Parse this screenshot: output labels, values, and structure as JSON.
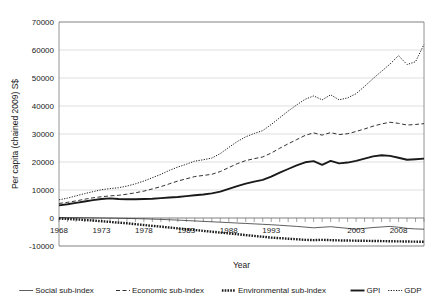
{
  "chart_data": {
    "type": "line",
    "title": "",
    "xlabel": "Year",
    "ylabel": "Per capita (chained 2009) S$",
    "xlim": [
      1968,
      2011
    ],
    "ylim": [
      -10000,
      70000
    ],
    "grid": true,
    "legend_position": "bottom",
    "ytick_labels": [
      "70000",
      "60000",
      "50000",
      "40000",
      "30000",
      "20000",
      "10000",
      "0",
      "-10000"
    ],
    "ytick_values": [
      70000,
      60000,
      50000,
      40000,
      30000,
      20000,
      10000,
      0,
      -10000
    ],
    "xtick_labels": [
      "1968",
      "1973",
      "1978",
      "1983",
      "1988",
      "1993",
      "2003",
      "2008"
    ],
    "xtick_values": [
      1968,
      1973,
      1978,
      1983,
      1988,
      1993,
      2003,
      2008
    ],
    "x": [
      1968,
      1969,
      1970,
      1971,
      1972,
      1973,
      1974,
      1975,
      1976,
      1977,
      1978,
      1979,
      1980,
      1981,
      1982,
      1983,
      1984,
      1985,
      1986,
      1987,
      1988,
      1989,
      1990,
      1991,
      1992,
      1993,
      1994,
      1995,
      1996,
      1997,
      1998,
      1999,
      2000,
      2001,
      2002,
      2003,
      2004,
      2005,
      2006,
      2007,
      2008,
      2009,
      2010,
      2011
    ],
    "series": [
      {
        "name": "Social sub-index",
        "style": "thin-solid",
        "values": [
          200,
          150,
          120,
          80,
          40,
          0,
          -40,
          -90,
          -150,
          -220,
          -300,
          -400,
          -500,
          -620,
          -750,
          -900,
          -1050,
          -1200,
          -1350,
          -1500,
          -1650,
          -1800,
          -1950,
          -2100,
          -2250,
          -2400,
          -2600,
          -2800,
          -3000,
          -3250,
          -3500,
          -3300,
          -3100,
          -3400,
          -3700,
          -4000,
          -3700,
          -3400,
          -3200,
          -3000,
          -3300,
          -3700,
          -3900,
          -4000
        ]
      },
      {
        "name": "Economic sub-index",
        "style": "dashed",
        "values": [
          5200,
          5600,
          6100,
          6700,
          7200,
          7600,
          7900,
          8100,
          8500,
          9000,
          9600,
          10400,
          11200,
          12200,
          13200,
          14000,
          14800,
          15200,
          15600,
          16600,
          18000,
          19400,
          20500,
          21200,
          21800,
          23200,
          24900,
          26500,
          28000,
          29500,
          30400,
          29600,
          30500,
          29800,
          30100,
          30900,
          31800,
          32800,
          33600,
          34200,
          33800,
          33200,
          33400,
          33700
        ]
      },
      {
        "name": "Environmental sub-index",
        "style": "dense-dotted",
        "values": [
          -200,
          -350,
          -500,
          -700,
          -900,
          -1150,
          -1400,
          -1650,
          -1900,
          -2200,
          -2500,
          -2800,
          -3100,
          -3400,
          -3700,
          -4000,
          -4300,
          -4600,
          -4900,
          -5200,
          -5500,
          -5800,
          -6100,
          -6400,
          -6700,
          -7000,
          -7200,
          -7400,
          -7600,
          -7800,
          -7900,
          -7800,
          -7900,
          -8000,
          -8050,
          -8100,
          -8150,
          -8200,
          -8250,
          -8300,
          -8350,
          -8400,
          -8450,
          -8500
        ]
      },
      {
        "name": "GPI",
        "style": "thick-solid",
        "values": [
          4500,
          4900,
          5400,
          5900,
          6400,
          6800,
          7000,
          6800,
          6700,
          6700,
          6800,
          6900,
          7100,
          7300,
          7500,
          7800,
          8100,
          8400,
          8800,
          9400,
          10400,
          11400,
          12300,
          13000,
          13600,
          14800,
          16200,
          17500,
          18800,
          19900,
          20300,
          19000,
          20400,
          19500,
          19800,
          20400,
          21200,
          22000,
          22400,
          22200,
          21500,
          20800,
          21000,
          21200
        ]
      },
      {
        "name": "GDP",
        "style": "fine-dotted",
        "values": [
          6500,
          7100,
          7900,
          8700,
          9400,
          10100,
          10500,
          10800,
          11400,
          12200,
          13200,
          14400,
          15600,
          17000,
          18200,
          19200,
          20300,
          20800,
          21400,
          23000,
          25200,
          27300,
          29000,
          30200,
          31200,
          33400,
          35800,
          38200,
          40400,
          42400,
          43600,
          42200,
          44000,
          42200,
          42900,
          44400,
          47000,
          49800,
          52400,
          55000,
          58000,
          54800,
          55800,
          62000
        ]
      }
    ]
  },
  "legend": {
    "items": [
      {
        "label": "Social sub-index",
        "style": "thin-solid"
      },
      {
        "label": "Economic sub-index",
        "style": "dashed"
      },
      {
        "label": "Environmental sub-index",
        "style": "dense-dotted"
      },
      {
        "label": "GPI",
        "style": "thick-solid"
      },
      {
        "label": "GDP",
        "style": "fine-dotted"
      }
    ]
  }
}
